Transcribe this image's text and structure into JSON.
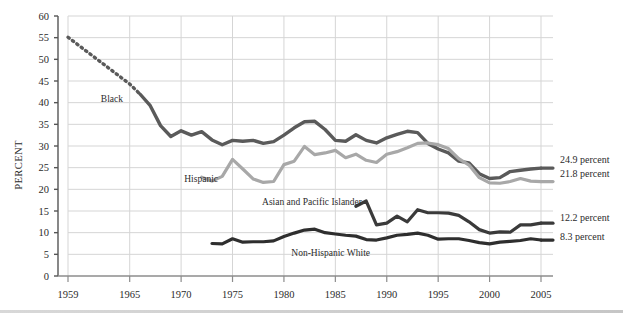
{
  "axes": {
    "ylabel": "PERCENT",
    "yticks": [
      0,
      5,
      10,
      15,
      20,
      25,
      30,
      35,
      40,
      45,
      50,
      55,
      60
    ],
    "ytick_labels": [
      "0",
      "5",
      "10",
      "15",
      "20",
      "25",
      "30",
      "35",
      "40",
      "45",
      "50",
      "55",
      "60"
    ],
    "xticks": [
      1959,
      1965,
      1970,
      1975,
      1980,
      1985,
      1990,
      1995,
      2000,
      2005
    ],
    "xtick_labels": [
      "1959",
      "1965",
      "1970",
      "1975",
      "1980",
      "1985",
      "1990",
      "1995",
      "2000",
      "2005"
    ],
    "ylim": [
      0,
      60
    ],
    "xlim": [
      1959,
      2005
    ],
    "grid": true
  },
  "series_labels": {
    "black": "Black",
    "hispanic": "Hispanic",
    "asian": "Asian and Pacific Islander",
    "white": "Non-Hispanic White"
  },
  "end_labels": {
    "black": "24.9 percent",
    "hispanic": "21.8 percent",
    "asian": "12.2 percent",
    "white": "8.3 percent"
  },
  "colors": {
    "black_series": "#5a5a5a",
    "hispanic_series": "#a8a8a8",
    "asian_series": "#3a3a3a",
    "white_series": "#2e2e2e",
    "grid": "#d5d5d5",
    "axis": "#8c8c8c",
    "text": "#2b2b2b"
  },
  "chart_data": {
    "type": "line",
    "title": "",
    "xlabel": "",
    "ylabel": "PERCENT",
    "xlim": [
      1959,
      2005
    ],
    "ylim": [
      0,
      60
    ],
    "grid": true,
    "legend": "inline-labels",
    "series": [
      {
        "name": "Black",
        "style": "dotted-then-solid",
        "dotted_range": [
          1959,
          1966
        ],
        "color": "#5a5a5a",
        "end_value": 24.9,
        "x": [
          1959,
          1960,
          1961,
          1962,
          1963,
          1964,
          1965,
          1966,
          1967,
          1968,
          1969,
          1970,
          1971,
          1972,
          1973,
          1974,
          1975,
          1976,
          1977,
          1978,
          1979,
          1980,
          1981,
          1982,
          1983,
          1984,
          1985,
          1986,
          1987,
          1988,
          1989,
          1990,
          1991,
          1992,
          1993,
          1994,
          1995,
          1996,
          1997,
          1998,
          1999,
          2000,
          2001,
          2002,
          2003,
          2004,
          2005
        ],
        "values": [
          55.1,
          53.3,
          51.5,
          49.7,
          47.9,
          46.1,
          44.3,
          42.0,
          39.3,
          34.7,
          32.2,
          33.5,
          32.5,
          33.3,
          31.4,
          30.3,
          31.3,
          31.1,
          31.3,
          30.6,
          31.0,
          32.5,
          34.2,
          35.6,
          35.7,
          33.8,
          31.3,
          31.1,
          32.6,
          31.3,
          30.7,
          31.9,
          32.7,
          33.4,
          33.1,
          30.6,
          29.3,
          28.4,
          26.5,
          26.1,
          23.6,
          22.5,
          22.7,
          24.1,
          24.4,
          24.7,
          24.9
        ]
      },
      {
        "name": "Hispanic",
        "style": "solid",
        "color": "#a8a8a8",
        "end_value": 21.8,
        "x": [
          1972,
          1973,
          1974,
          1975,
          1976,
          1977,
          1978,
          1979,
          1980,
          1981,
          1982,
          1983,
          1984,
          1985,
          1986,
          1987,
          1988,
          1989,
          1990,
          1991,
          1992,
          1993,
          1994,
          1995,
          1996,
          1997,
          1998,
          1999,
          2000,
          2001,
          2002,
          2003,
          2004,
          2005
        ],
        "values": [
          22.8,
          21.9,
          23.0,
          26.9,
          24.7,
          22.4,
          21.6,
          21.8,
          25.7,
          26.5,
          29.9,
          28.0,
          28.4,
          29.0,
          27.3,
          28.1,
          26.7,
          26.2,
          28.1,
          28.7,
          29.6,
          30.6,
          30.7,
          30.3,
          29.4,
          27.1,
          25.6,
          22.7,
          21.5,
          21.4,
          21.8,
          22.5,
          21.9,
          21.8
        ]
      },
      {
        "name": "Asian and Pacific Islander",
        "style": "solid",
        "color": "#3a3a3a",
        "end_value": 12.2,
        "x": [
          1987,
          1988,
          1989,
          1990,
          1991,
          1992,
          1993,
          1994,
          1995,
          1996,
          1997,
          1998,
          1999,
          2000,
          2001,
          2002,
          2003,
          2004,
          2005
        ],
        "values": [
          16.1,
          17.3,
          11.8,
          12.2,
          13.8,
          12.5,
          15.3,
          14.6,
          14.6,
          14.5,
          14.0,
          12.5,
          10.7,
          9.9,
          10.2,
          10.1,
          11.8,
          11.8,
          12.2
        ]
      },
      {
        "name": "Non-Hispanic White",
        "style": "solid",
        "color": "#2e2e2e",
        "end_value": 8.3,
        "x": [
          1973,
          1974,
          1975,
          1976,
          1977,
          1978,
          1979,
          1980,
          1981,
          1982,
          1983,
          1984,
          1985,
          1986,
          1987,
          1988,
          1989,
          1990,
          1991,
          1992,
          1993,
          1994,
          1995,
          1996,
          1997,
          1998,
          1999,
          2000,
          2001,
          2002,
          2003,
          2004,
          2005
        ],
        "values": [
          7.5,
          7.4,
          8.6,
          7.8,
          7.9,
          7.9,
          8.1,
          9.1,
          9.9,
          10.6,
          10.8,
          10.0,
          9.7,
          9.4,
          9.2,
          8.4,
          8.3,
          8.8,
          9.4,
          9.6,
          9.9,
          9.4,
          8.5,
          8.6,
          8.6,
          8.2,
          7.7,
          7.4,
          7.8,
          8.0,
          8.2,
          8.6,
          8.3
        ]
      }
    ]
  }
}
